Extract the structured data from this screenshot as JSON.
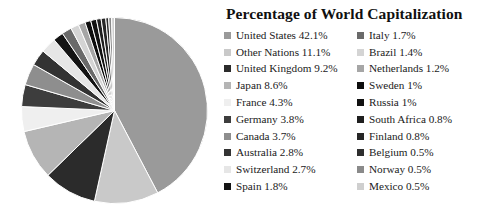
{
  "title": "Percentage of World Capitalization",
  "chart_data": {
    "type": "pie",
    "title": "Percentage of World Capitalization",
    "xlabel": "",
    "ylabel": "",
    "legend_position": "right",
    "legend_columns": 2,
    "unit": "%",
    "start_angle_deg": 0,
    "direction": "clockwise",
    "categories": [
      "United States",
      "Other Nations",
      "United Kingdom",
      "Japan",
      "France",
      "Germany",
      "Canada",
      "Australia",
      "Switzerland",
      "Spain",
      "Italy",
      "Brazil",
      "Netherlands",
      "Sweden",
      "Russia",
      "South Africa",
      "Finland",
      "Belgium",
      "Norway",
      "Mexico"
    ],
    "values": [
      42.1,
      11.1,
      9.2,
      8.6,
      4.3,
      3.8,
      3.7,
      2.8,
      2.7,
      1.8,
      1.7,
      1.4,
      1.2,
      1.0,
      1.0,
      0.8,
      0.8,
      0.5,
      0.5,
      0.5
    ],
    "colors": [
      "#9a9a9a",
      "#c9c9c9",
      "#2b2b2b",
      "#b5b5b5",
      "#efefef",
      "#3d3d3d",
      "#8e8e8e",
      "#333333",
      "#e6e6e6",
      "#141414",
      "#6a6a6a",
      "#d4d4d4",
      "#a6a6a6",
      "#0d0d0d",
      "#111111",
      "#1f1f1f",
      "#262626",
      "#2e2e2e",
      "#8a8a8a",
      "#cfcfcf"
    ],
    "slice_separator_color": "#ffffff"
  },
  "legend": {
    "left_column": [
      {
        "label": "United States 42.1%",
        "name": "United States",
        "value": 42.1,
        "color": "#9a9a9a"
      },
      {
        "label": "Other Nations 11.1%",
        "name": "Other Nations",
        "value": 11.1,
        "color": "#c9c9c9"
      },
      {
        "label": "United Kingdom 9.2%",
        "name": "United Kingdom",
        "value": 9.2,
        "color": "#2b2b2b"
      },
      {
        "label": "Japan 8.6%",
        "name": "Japan",
        "value": 8.6,
        "color": "#b5b5b5"
      },
      {
        "label": "France 4.3%",
        "name": "France",
        "value": 4.3,
        "color": "#efefef"
      },
      {
        "label": "Germany 3.8%",
        "name": "Germany",
        "value": 3.8,
        "color": "#3d3d3d"
      },
      {
        "label": "Canada 3.7%",
        "name": "Canada",
        "value": 3.7,
        "color": "#8e8e8e"
      },
      {
        "label": "Australia 2.8%",
        "name": "Australia",
        "value": 2.8,
        "color": "#333333"
      },
      {
        "label": "Switzerland 2.7%",
        "name": "Switzerland",
        "value": 2.7,
        "color": "#e6e6e6"
      },
      {
        "label": "Spain 1.8%",
        "name": "Spain",
        "value": 1.8,
        "color": "#141414"
      }
    ],
    "right_column": [
      {
        "label": "Italy 1.7%",
        "name": "Italy",
        "value": 1.7,
        "color": "#6a6a6a"
      },
      {
        "label": "Brazil 1.4%",
        "name": "Brazil",
        "value": 1.4,
        "color": "#d4d4d4"
      },
      {
        "label": "Netherlands 1.2%",
        "name": "Netherlands",
        "value": 1.2,
        "color": "#a6a6a6"
      },
      {
        "label": "Sweden 1%",
        "name": "Sweden",
        "value": 1.0,
        "color": "#0d0d0d"
      },
      {
        "label": "Russia 1%",
        "name": "Russia",
        "value": 1.0,
        "color": "#111111"
      },
      {
        "label": "South Africa 0.8%",
        "name": "South Africa",
        "value": 0.8,
        "color": "#1f1f1f"
      },
      {
        "label": "Finland 0.8%",
        "name": "Finland",
        "value": 0.8,
        "color": "#262626"
      },
      {
        "label": "Belgium 0.5%",
        "name": "Belgium",
        "value": 0.5,
        "color": "#2e2e2e"
      },
      {
        "label": "Norway 0.5%",
        "name": "Norway",
        "value": 0.5,
        "color": "#8a8a8a"
      },
      {
        "label": "Mexico 0.5%",
        "name": "Mexico",
        "value": 0.5,
        "color": "#cfcfcf"
      }
    ]
  }
}
